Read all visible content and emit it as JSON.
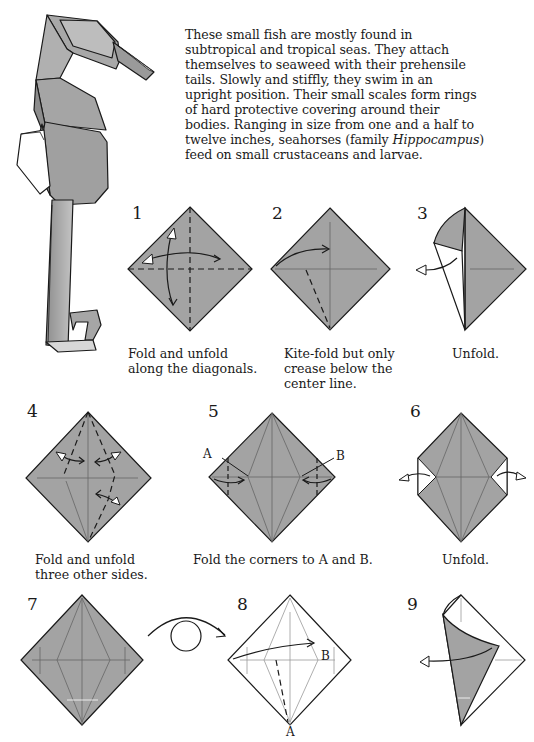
{
  "intro": {
    "lines": [
      "These small fish are mostly found in",
      "subtropical and tropical seas. They attach",
      "themselves to seaweed with their prehensile",
      "tails. Slowly and stiffly, they swim in an",
      "upright position. Their small scales form rings",
      "of hard protective covering around their",
      "bodies. Ranging in size from one and a half to",
      "twelve inches, seahorses (family ",
      "feed on small crustaceans and larvae."
    ],
    "italic_term": "Hippocampus",
    "after_italic": ")"
  },
  "colors": {
    "paper": "#a3a3a3",
    "line": "#1a1a1a",
    "crease": "#6a6a6a",
    "white": "#ffffff"
  },
  "steps": [
    {
      "number": "1",
      "caption": [
        "Fold and unfold",
        "along the diagonals."
      ]
    },
    {
      "number": "2",
      "caption": [
        "Kite-fold but only",
        "crease below the",
        "center line."
      ]
    },
    {
      "number": "3",
      "caption": [
        "Unfold."
      ]
    },
    {
      "number": "4",
      "caption": [
        "Fold and unfold",
        "three other sides."
      ]
    },
    {
      "number": "5",
      "caption": [
        "Fold the corners to A and B."
      ],
      "labels": [
        "A",
        "B"
      ]
    },
    {
      "number": "6",
      "caption": [
        "Unfold."
      ]
    },
    {
      "number": "7",
      "caption": []
    },
    {
      "number": "8",
      "caption": [],
      "labels": [
        "B",
        "A"
      ]
    },
    {
      "number": "9",
      "caption": []
    }
  ]
}
